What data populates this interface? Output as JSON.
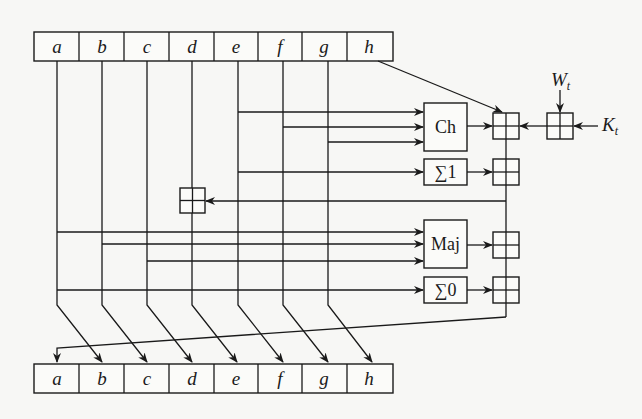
{
  "diagram": {
    "title": "",
    "type": "SHA-256 compression round",
    "input_registers": [
      "a",
      "b",
      "c",
      "d",
      "e",
      "f",
      "g",
      "h"
    ],
    "output_registers": [
      "a",
      "b",
      "c",
      "d",
      "e",
      "f",
      "g",
      "h"
    ],
    "functions": {
      "ch": "Ch",
      "sigma1": "∑1",
      "maj": "Maj",
      "sigma0": "∑0"
    },
    "external_inputs": {
      "w": {
        "base": "W",
        "sub": "t"
      },
      "k": {
        "base": "K",
        "sub": "t"
      }
    },
    "adder_symbol": "modular-addition (boxed plus)",
    "edges": [
      {
        "from": "h",
        "to": "adder1"
      },
      {
        "from": "e",
        "to": "Ch"
      },
      {
        "from": "f",
        "to": "Ch"
      },
      {
        "from": "g",
        "to": "Ch"
      },
      {
        "from": "Ch",
        "to": "adder1"
      },
      {
        "from": "W_t",
        "to": "adderW"
      },
      {
        "from": "K_t",
        "to": "adderW"
      },
      {
        "from": "adderW",
        "to": "adder1"
      },
      {
        "from": "e",
        "to": "∑1"
      },
      {
        "from": "∑1",
        "to": "adder2"
      },
      {
        "from": "adder1",
        "to": "adder2"
      },
      {
        "from": "adder2",
        "to": "adderD"
      },
      {
        "from": "d",
        "to": "adderD"
      },
      {
        "from": "a",
        "to": "Maj"
      },
      {
        "from": "b",
        "to": "Maj"
      },
      {
        "from": "c",
        "to": "Maj"
      },
      {
        "from": "Maj",
        "to": "adder3"
      },
      {
        "from": "adder2",
        "to": "adder3"
      },
      {
        "from": "a",
        "to": "∑0"
      },
      {
        "from": "∑0",
        "to": "adder4"
      },
      {
        "from": "adder3",
        "to": "adder4"
      },
      {
        "from": "adder4",
        "to": "out.a"
      },
      {
        "from": "a",
        "to": "out.b"
      },
      {
        "from": "b",
        "to": "out.c"
      },
      {
        "from": "c",
        "to": "out.d"
      },
      {
        "from": "adderD",
        "to": "out.e"
      },
      {
        "from": "e",
        "to": "out.f"
      },
      {
        "from": "f",
        "to": "out.g"
      },
      {
        "from": "g",
        "to": "out.h"
      }
    ]
  }
}
